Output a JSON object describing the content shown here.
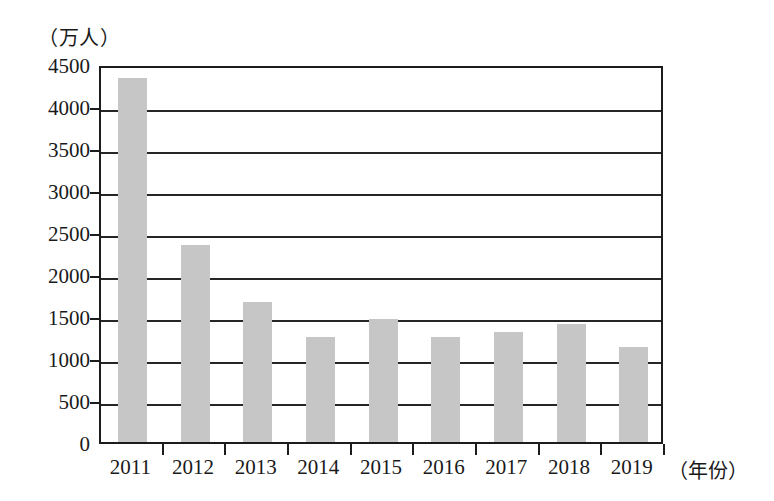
{
  "chart_data": {
    "type": "bar",
    "title": "",
    "xlabel": "（年份）",
    "ylabel": "（万人）",
    "categories": [
      "2011",
      "2012",
      "2013",
      "2014",
      "2015",
      "2016",
      "2017",
      "2018",
      "2019"
    ],
    "values": [
      4330,
      2350,
      1670,
      1250,
      1470,
      1250,
      1310,
      1400,
      1130
    ],
    "series": [
      {
        "name": "",
        "values": [
          4330,
          2350,
          1670,
          1250,
          1470,
          1250,
          1310,
          1400,
          1130
        ]
      }
    ],
    "ylim": [
      0,
      4500
    ],
    "ytick_values": [
      0,
      500,
      1000,
      1500,
      2000,
      2500,
      3000,
      3500,
      4000,
      4500
    ],
    "ytick_labels": [
      "0",
      "500",
      "1000",
      "1500",
      "2000",
      "2500",
      "3000",
      "3500",
      "4000",
      "4500"
    ],
    "grid": true,
    "grid_axis": "y",
    "legend": false,
    "legend_position": "none",
    "bar_color": "#c6c6c6",
    "axis_color": "#1c1c1c"
  },
  "axes": {
    "y_unit_caption": "（万人）",
    "x_unit_caption": "（年份）"
  }
}
